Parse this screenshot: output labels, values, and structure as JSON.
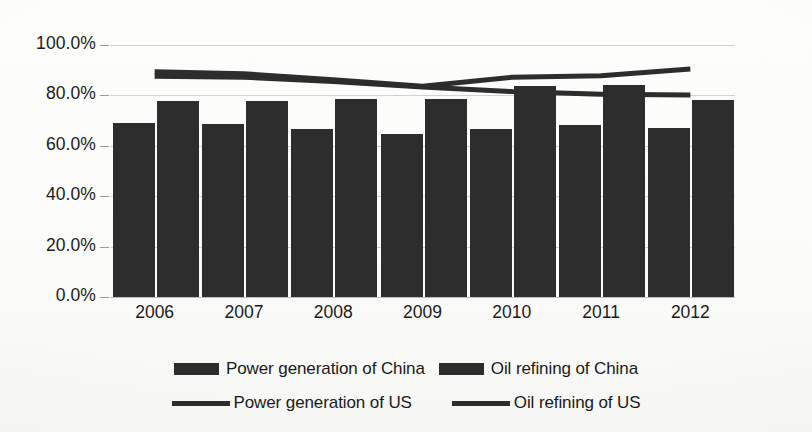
{
  "chart_data": {
    "type": "bar",
    "title": "",
    "subtitle": "",
    "xlabel": "",
    "ylabel": "",
    "grid": true,
    "legend_position": "bottom",
    "categories": [
      "2006",
      "2007",
      "2008",
      "2009",
      "2010",
      "2011",
      "2012"
    ],
    "ylim": [
      0,
      1.0
    ],
    "ytick_labels": [
      "100.0%",
      "80.0%",
      "60.0%",
      "40.0%",
      "20.0%",
      "0.0%"
    ],
    "ytick_values": [
      1.0,
      0.8,
      0.6,
      0.4,
      0.2,
      0.0
    ],
    "y_axis_format": "percent",
    "series": [
      {
        "name": "Power generation of China",
        "kind": "bar",
        "color": "#2d2d2d",
        "values": [
          0.69,
          0.688,
          0.665,
          0.648,
          0.665,
          0.681,
          0.67
        ]
      },
      {
        "name": "Oil refining of China",
        "kind": "bar",
        "color": "#2d2d2d",
        "values": [
          0.779,
          0.779,
          0.787,
          0.786,
          0.837,
          0.84,
          0.783
        ]
      },
      {
        "name": "Power generation of US",
        "kind": "line",
        "color": "#2d2d2d",
        "values": [
          0.876,
          0.872,
          0.855,
          0.833,
          0.815,
          0.805,
          0.802
        ]
      },
      {
        "name": "Oil refining of US",
        "kind": "line",
        "color": "#2d2d2d",
        "values": [
          0.894,
          0.886,
          0.862,
          0.836,
          0.872,
          0.878,
          0.905
        ]
      }
    ]
  },
  "legend": {
    "row1": [
      {
        "label": "Power generation of China",
        "marker": "box"
      },
      {
        "label": "Oil refining of China",
        "marker": "box"
      }
    ],
    "row2": [
      {
        "label": "Power generation of US",
        "marker": "line"
      },
      {
        "label": "Oil refining of US",
        "marker": "line"
      }
    ]
  },
  "colors": {
    "series_fill": "#2d2d2d",
    "gridline": "#d2d2d0",
    "text": "#1a1a1a",
    "background": "#fbfbfa"
  }
}
